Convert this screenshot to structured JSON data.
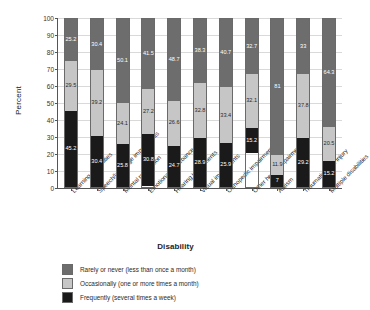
{
  "chart_data": {
    "type": "bar",
    "subtype": "stacked-percent",
    "title": "",
    "xlabel": "Disability",
    "ylabel": "Percent",
    "ylim": [
      0,
      100
    ],
    "ytick_step": 10,
    "yticks": [
      0,
      10,
      20,
      30,
      40,
      50,
      60,
      70,
      80,
      90,
      100
    ],
    "grid": true,
    "legend_position": "bottom-left",
    "stack_order_bottom_to_top": [
      "Frequently (several times a week)",
      "Occasionally (one or more times a month)",
      "Rarely or never (less than once a month)"
    ],
    "categories": [
      "Learning disabilities",
      "Speech/language impairments",
      "Mental retardation",
      "Emotional disturbance",
      "Hearing impairments",
      "Visual impairments",
      "Orthopedic impairments",
      "Other health impairments",
      "Autism",
      "Traumatic brain injury",
      "Multiple disabilities"
    ],
    "series": [
      {
        "name": "Rarely or never (less than once a month)",
        "color": "#6d6d6d",
        "values": [
          25.2,
          30.4,
          50.1,
          41.5,
          48.7,
          38.3,
          40.7,
          32.7,
          81,
          33,
          64.3
        ]
      },
      {
        "name": "Occasionally (one or more times a month)",
        "color": "#c6c6c6",
        "values": [
          29.5,
          39.2,
          24.1,
          27.2,
          26.6,
          32.8,
          33.4,
          32.1,
          11.9,
          37.8,
          20.5
        ]
      },
      {
        "name": "Frequently (several times a week)",
        "color": "#1a1a1a",
        "values": [
          45.2,
          30.4,
          25.8,
          30.8,
          24.7,
          28.9,
          25.9,
          15.2,
          7,
          29.2,
          15.2
        ]
      }
    ]
  },
  "legend": {
    "items": [
      {
        "label": "Rarely or never (less than once a month)",
        "color": "#6d6d6d"
      },
      {
        "label": "Occasionally (one or more times a month)",
        "color": "#c6c6c6"
      },
      {
        "label": "Frequently (several times a week)",
        "color": "#1a1a1a"
      }
    ]
  }
}
